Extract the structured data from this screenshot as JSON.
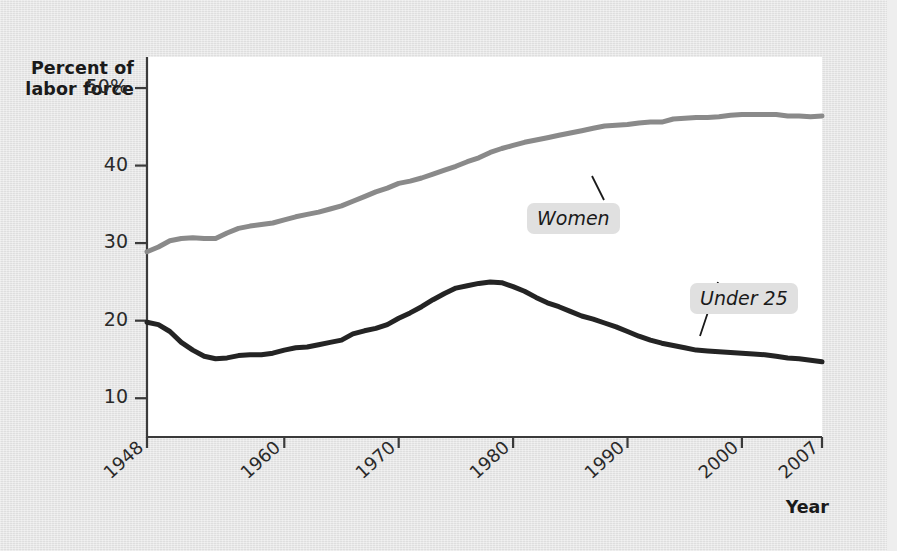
{
  "figure": {
    "background_color": "#e4e4e4",
    "plot_background_color": "#ffffff"
  },
  "axis": {
    "y_title_line1": "Percent of",
    "y_title_line2": "labor force",
    "x_title": "Year"
  },
  "chart_data": {
    "type": "line",
    "title": "",
    "subtitle": "",
    "xlabel": "Year",
    "ylabel": "Percent of labor force",
    "xlim": [
      1948,
      2007
    ],
    "ylim": [
      5,
      54
    ],
    "grid": false,
    "legend_position": "inline-annotations",
    "y_tick_labels": [
      "50%",
      "40",
      "30",
      "20",
      "10"
    ],
    "y_tick_values": [
      50,
      40,
      30,
      20,
      10
    ],
    "x_tick_labels": [
      "1948",
      "1960",
      "1970",
      "1980",
      "1990",
      "2000",
      "2007"
    ],
    "x_tick_values": [
      1948,
      1960,
      1970,
      1980,
      1990,
      2000,
      2007
    ],
    "annotations": [
      {
        "text": "Women",
        "series": "Women"
      },
      {
        "text": "Under 25",
        "series": "Under 25"
      }
    ],
    "series": [
      {
        "name": "Women",
        "color": "#8a8a8a",
        "line_width": 5,
        "x": [
          1948,
          1949,
          1950,
          1951,
          1952,
          1953,
          1954,
          1955,
          1956,
          1957,
          1958,
          1959,
          1960,
          1961,
          1962,
          1963,
          1964,
          1965,
          1966,
          1967,
          1968,
          1969,
          1970,
          1971,
          1972,
          1973,
          1974,
          1975,
          1976,
          1977,
          1978,
          1979,
          1980,
          1981,
          1982,
          1983,
          1984,
          1985,
          1986,
          1987,
          1988,
          1989,
          1990,
          1991,
          1992,
          1993,
          1994,
          1995,
          1996,
          1997,
          1998,
          1999,
          2000,
          2001,
          2002,
          2003,
          2004,
          2005,
          2006,
          2007
        ],
        "values": [
          28.9,
          29.5,
          30.3,
          30.6,
          30.7,
          30.6,
          30.6,
          31.3,
          31.9,
          32.2,
          32.4,
          32.6,
          33.0,
          33.4,
          33.7,
          34.0,
          34.4,
          34.8,
          35.4,
          36.0,
          36.6,
          37.1,
          37.7,
          38.0,
          38.4,
          38.9,
          39.4,
          39.9,
          40.5,
          41.0,
          41.7,
          42.2,
          42.6,
          43.0,
          43.3,
          43.6,
          43.9,
          44.2,
          44.5,
          44.8,
          45.1,
          45.2,
          45.3,
          45.5,
          45.6,
          45.6,
          46.0,
          46.1,
          46.2,
          46.2,
          46.3,
          46.5,
          46.6,
          46.6,
          46.6,
          46.6,
          46.4,
          46.4,
          46.3,
          46.4
        ]
      },
      {
        "name": "Under 25",
        "color": "#242424",
        "line_width": 5,
        "x": [
          1948,
          1949,
          1950,
          1951,
          1952,
          1953,
          1954,
          1955,
          1956,
          1957,
          1958,
          1959,
          1960,
          1961,
          1962,
          1963,
          1964,
          1965,
          1966,
          1967,
          1968,
          1969,
          1970,
          1971,
          1972,
          1973,
          1974,
          1975,
          1976,
          1977,
          1978,
          1979,
          1980,
          1981,
          1982,
          1983,
          1984,
          1985,
          1986,
          1987,
          1988,
          1989,
          1990,
          1991,
          1992,
          1993,
          1994,
          1995,
          1996,
          1997,
          1998,
          1999,
          2000,
          2001,
          2002,
          2003,
          2004,
          2005,
          2006,
          2007
        ],
        "values": [
          19.8,
          19.5,
          18.6,
          17.2,
          16.2,
          15.4,
          15.1,
          15.2,
          15.5,
          15.6,
          15.6,
          15.8,
          16.2,
          16.5,
          16.6,
          16.9,
          17.2,
          17.5,
          18.3,
          18.7,
          19.0,
          19.5,
          20.3,
          21.0,
          21.8,
          22.7,
          23.5,
          24.2,
          24.5,
          24.8,
          25.0,
          24.9,
          24.4,
          23.8,
          23.0,
          22.3,
          21.8,
          21.2,
          20.6,
          20.2,
          19.7,
          19.2,
          18.6,
          18.0,
          17.5,
          17.1,
          16.8,
          16.5,
          16.2,
          16.1,
          16.0,
          15.9,
          15.8,
          15.7,
          15.6,
          15.4,
          15.2,
          15.1,
          14.9,
          14.7
        ]
      }
    ]
  }
}
